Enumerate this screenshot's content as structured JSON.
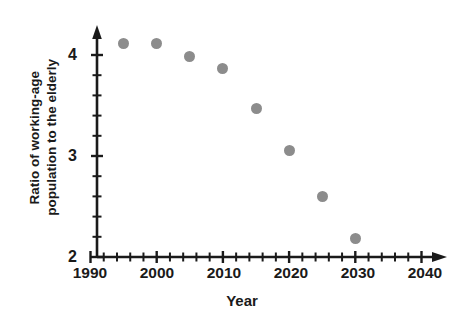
{
  "chart_data": {
    "type": "scatter",
    "title": "",
    "xlabel": "Year",
    "ylabel": "Ratio of working-age population to the elderly",
    "ylabel_lines": [
      "Ratio of working-age",
      "population to the elderly"
    ],
    "x": [
      1995,
      2000,
      2005,
      2010,
      2015,
      2020,
      2025,
      2030
    ],
    "values": [
      4.11,
      4.11,
      3.99,
      3.87,
      3.47,
      3.05,
      2.6,
      2.18
    ],
    "series": [
      {
        "name": "Ratio of working-age population to the elderly",
        "values": [
          4.11,
          4.11,
          3.99,
          3.87,
          3.47,
          3.05,
          2.6,
          2.18
        ]
      }
    ],
    "points": [
      {
        "x": 1995,
        "y": 4.11
      },
      {
        "x": 2000,
        "y": 4.11
      },
      {
        "x": 2005,
        "y": 3.99
      },
      {
        "x": 2010,
        "y": 3.87
      },
      {
        "x": 2015,
        "y": 3.47
      },
      {
        "x": 2020,
        "y": 3.05
      },
      {
        "x": 2025,
        "y": 2.6
      },
      {
        "x": 2030,
        "y": 2.18
      }
    ],
    "xlim": [
      1990,
      2042
    ],
    "ylim": [
      2,
      4.35
    ],
    "xticks_major": [
      1990,
      2000,
      2010,
      2020,
      2030,
      2040
    ],
    "xtick_labels": [
      "1990",
      "2000",
      "2010",
      "2020",
      "2030",
      "2040"
    ],
    "xtick_minor_step": 2,
    "yticks_major": [
      2,
      3,
      4
    ],
    "ytick_labels": [
      "2",
      "3",
      "4"
    ],
    "ytick_minor_step": 0.2,
    "grid": false,
    "legend": null,
    "marker_color": "#8c8c8c",
    "axis_color": "#1a1a1a",
    "background_color": "#ffffff"
  }
}
